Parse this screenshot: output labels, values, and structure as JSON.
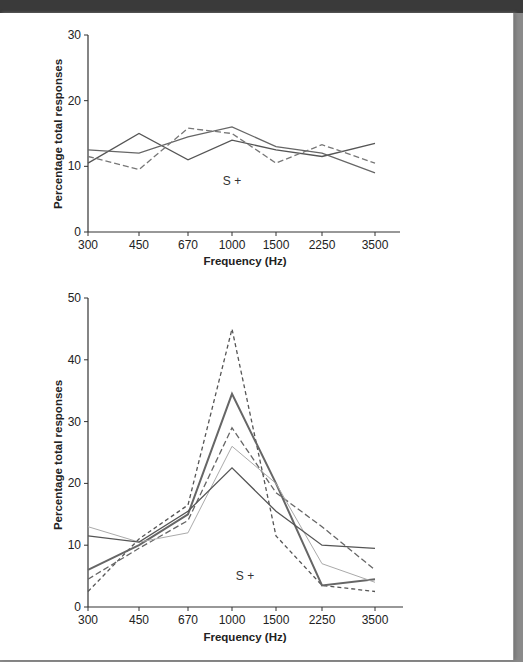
{
  "chart_data": [
    {
      "type": "line",
      "title": "",
      "annotation": "S +",
      "xlabel": "Frequency (Hz)",
      "ylabel": "Percentage total responses",
      "categories": [
        "300",
        "450",
        "670",
        "1000",
        "1500",
        "2250",
        "3500"
      ],
      "yticks": [
        "0",
        "10",
        "20",
        "30"
      ],
      "ylim": [
        0,
        30
      ],
      "grid": false,
      "series": [
        {
          "name": "solid A",
          "style": "solid",
          "color": "#555",
          "values": [
            10.5,
            15,
            11,
            14,
            12.5,
            11.5,
            13.5
          ]
        },
        {
          "name": "solid B",
          "style": "solid",
          "color": "#666",
          "values": [
            12.5,
            12,
            14.5,
            16,
            13,
            12,
            9
          ]
        },
        {
          "name": "dashed",
          "style": "dashed",
          "color": "#777",
          "values": [
            11.5,
            9.5,
            15.8,
            15,
            10.5,
            13.3,
            10.5
          ]
        }
      ]
    },
    {
      "type": "line",
      "title": "",
      "annotation": "S +",
      "xlabel": "Frequency (Hz)",
      "ylabel": "Percentage total responses",
      "categories": [
        "300",
        "450",
        "670",
        "1000",
        "1500",
        "2250",
        "3500"
      ],
      "yticks": [
        "0",
        "10",
        "20",
        "30",
        "40",
        "50"
      ],
      "ylim": [
        0,
        50
      ],
      "grid": false,
      "series": [
        {
          "name": "dotted peak",
          "style": "dotted",
          "color": "#555",
          "values": [
            2.5,
            11,
            16.5,
            45,
            11.5,
            3.5,
            2.5
          ]
        },
        {
          "name": "thick solid",
          "style": "solid-thick",
          "color": "#666",
          "values": [
            6,
            10,
            15,
            34.5,
            20,
            3.5,
            4.5
          ]
        },
        {
          "name": "dashed",
          "style": "dashed",
          "color": "#666",
          "values": [
            4.5,
            9.5,
            14,
            29,
            18.5,
            13,
            6
          ]
        },
        {
          "name": "light solid",
          "style": "solid-light",
          "color": "#aaa",
          "values": [
            13,
            10.5,
            12,
            26,
            20,
            7,
            4
          ]
        },
        {
          "name": "solid",
          "style": "solid",
          "color": "#555",
          "values": [
            11.5,
            10.5,
            15.5,
            22.5,
            15.5,
            10,
            9.5
          ]
        }
      ]
    }
  ]
}
